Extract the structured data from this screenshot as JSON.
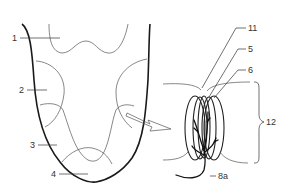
{
  "diagram": {
    "colors": {
      "outline": "#1a1a1a",
      "zone_lines": "#555555",
      "text": "#333333",
      "background": "#ffffff"
    },
    "tongue_labels": [
      {
        "id": "1",
        "text": "1"
      },
      {
        "id": "2",
        "text": "2"
      },
      {
        "id": "3",
        "text": "3"
      },
      {
        "id": "4",
        "text": "4"
      }
    ],
    "taste_bud_labels": [
      {
        "id": "11",
        "text": "11"
      },
      {
        "id": "5",
        "text": "5"
      },
      {
        "id": "6",
        "text": "6"
      },
      {
        "id": "12",
        "text": "12"
      },
      {
        "id": "8a",
        "text": "8a"
      }
    ],
    "arrow": {
      "icon": "magnify-arrow-icon",
      "direction": "right-down"
    }
  }
}
